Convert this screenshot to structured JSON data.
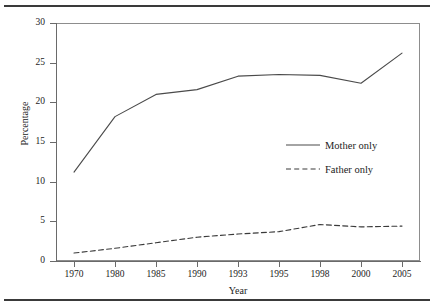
{
  "chart_data": {
    "type": "line",
    "title": "",
    "xlabel": "Year",
    "ylabel": "Percentage",
    "categories": [
      "1970",
      "1980",
      "1985",
      "1990",
      "1993",
      "1995",
      "1998",
      "2000",
      "2005"
    ],
    "ylim": [
      0,
      30
    ],
    "yticks": [
      0,
      5,
      10,
      15,
      20,
      25,
      30
    ],
    "ytick_labels": [
      "0",
      "5",
      "10",
      "15",
      "20",
      "25",
      "30"
    ],
    "grid": false,
    "legend_position": "center-right-inside",
    "series": [
      {
        "name": "Mother only",
        "style": "solid",
        "color": "#4a4a4a",
        "values": [
          11.2,
          18.2,
          21.0,
          21.6,
          23.3,
          23.5,
          23.4,
          22.4,
          26.2
        ]
      },
      {
        "name": "Father only",
        "style": "dashed",
        "color": "#3a3a3a",
        "values": [
          1.0,
          1.6,
          2.3,
          3.0,
          3.4,
          3.7,
          4.6,
          4.3,
          4.4
        ]
      }
    ]
  },
  "figure": {
    "rule_color": "#3a3a3a",
    "frame_color": "#8d8d8d",
    "background": "#ffffff"
  }
}
